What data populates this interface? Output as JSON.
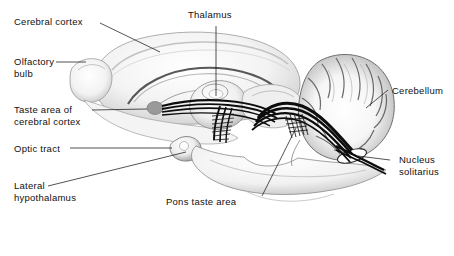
{
  "figure": {
    "style": "grayscale airbrush anatomical illustration",
    "background_color": "#ffffff",
    "ink_color": "#101010",
    "rule": {
      "present": true,
      "color": "#555555",
      "x_start": 18,
      "x_end": 438,
      "y": 238
    }
  },
  "labels": {
    "cerebral_cortex": "Cerebral cortex",
    "olfactory_bulb_line1": "Olfactory",
    "olfactory_bulb_line2": "bulb",
    "taste_area_line1": "Taste area of",
    "taste_area_line2": "cerebral cortex",
    "optic_tract": "Optic tract",
    "lateral_hypothalamus_line1": "Lateral",
    "lateral_hypothalamus_line2": "hypothalamus",
    "thalamus": "Thalamus",
    "pons_taste_area": "Pons taste area",
    "cerebellum": "Cerebellum",
    "nucleus_solitarius_line1": "Nucleus",
    "nucleus_solitarius_line2": "solitarius"
  },
  "structures": [
    {
      "name": "cerebral-cortex",
      "kind": "region",
      "fill": "#f2f2f2"
    },
    {
      "name": "olfactory-bulb",
      "kind": "region",
      "fill": "#f4f4f4"
    },
    {
      "name": "taste-area-ellipse",
      "kind": "marker",
      "fill": "#9a9a9a"
    },
    {
      "name": "thalamus",
      "kind": "region",
      "fill": "#ededed"
    },
    {
      "name": "optic-tract-knob",
      "kind": "region",
      "fill": "#efefef"
    },
    {
      "name": "cerebellum",
      "kind": "region",
      "fill": "#f0f0f0"
    },
    {
      "name": "brainstem",
      "kind": "region",
      "fill": "#f1f1f1"
    },
    {
      "name": "nucleus-solitarius",
      "kind": "marker",
      "fill": "#ffffff"
    },
    {
      "name": "gustatory-tract",
      "kind": "pathway",
      "stroke": "#0d0d0d"
    }
  ]
}
